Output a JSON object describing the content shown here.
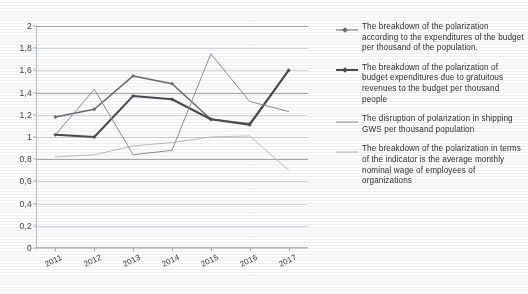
{
  "chart_data": {
    "type": "line",
    "title": "",
    "xlabel": "",
    "ylabel": "",
    "ylim": [
      0,
      2
    ],
    "ystep": 0.2,
    "grid": true,
    "legend_position": "right",
    "decimal_separator": ",",
    "categories": [
      "2011",
      "2012",
      "2013",
      "2014",
      "2015",
      "2016",
      "2017"
    ],
    "ytick_labels": [
      "0",
      "0,2",
      "0,4",
      "0,6",
      "0,8",
      "1",
      "1,2",
      "1,4",
      "1,6",
      "1,8",
      "2"
    ],
    "ytick_values": [
      0,
      0.2,
      0.4,
      0.6,
      0.8,
      1.0,
      1.2,
      1.4,
      1.6,
      1.8,
      2.0
    ],
    "series": [
      {
        "name": "The breakdown of the polarization according to the expenditures of the budget per thousand of the population.",
        "values": [
          1.18,
          1.25,
          1.55,
          1.48,
          1.16,
          1.12,
          1.6
        ],
        "color": "#6b6b70",
        "marker": "diamond",
        "width": 1.6
      },
      {
        "name": "The breakdown of the polarization of budget expenditures due to gratuitous revenues to the budget per thousand people",
        "values": [
          1.02,
          1.0,
          1.37,
          1.34,
          1.16,
          1.11,
          1.6
        ],
        "color": "#4a4a50",
        "marker": "diamond",
        "width": 2.0
      },
      {
        "name": "The disruption of polarization in shipping GWS per thousand population",
        "values": [
          1.02,
          1.43,
          0.84,
          0.88,
          1.75,
          1.32,
          1.23
        ],
        "color": "#8e8e96",
        "marker": "none",
        "width": 1.0
      },
      {
        "name": "The breakdown of the polarization in terms of the indicator is the average monthly nominal wage of employees of organizations",
        "values": [
          0.82,
          0.84,
          0.92,
          0.95,
          1.0,
          1.01,
          0.7
        ],
        "color": "#b3b3ba",
        "marker": "none",
        "width": 0.9
      }
    ]
  },
  "legend": {
    "items": [
      {
        "label": "The breakdown of the polarization according to the expenditures of the budget per thousand of the population."
      },
      {
        "label": "The breakdown of the polarization of budget expenditures due to gratuitous revenues to the budget per thousand people"
      },
      {
        "label": "The disruption of polarization in shipping GWS per thousand population"
      },
      {
        "label": "The breakdown of the polarization in terms of the indicator is the average monthly nominal wage of employees of organizations"
      }
    ]
  }
}
